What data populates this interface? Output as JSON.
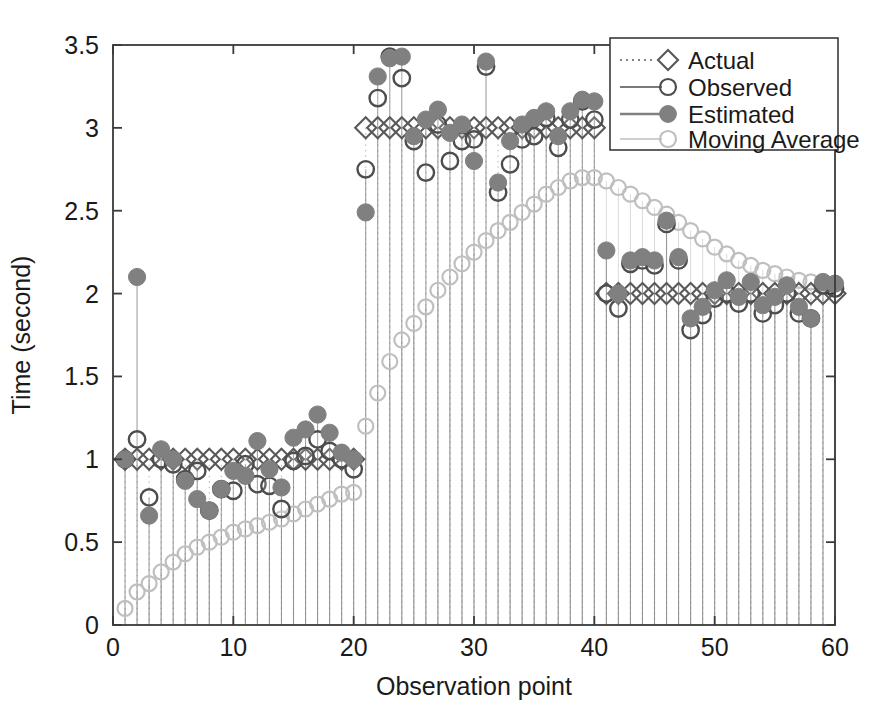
{
  "chart_data": {
    "type": "scatter",
    "title": "",
    "xlabel": "Observation point",
    "ylabel": "Time (second)",
    "xlim": [
      0,
      60
    ],
    "ylim": [
      0,
      3.5
    ],
    "xticks": [
      0,
      10,
      20,
      30,
      40,
      50,
      60
    ],
    "xtick_labels": [
      "0",
      "10",
      "20",
      "30",
      "40",
      "50",
      "60"
    ],
    "yticks": [
      0,
      0.5,
      1,
      1.5,
      2,
      2.5,
      3,
      3.5
    ],
    "ytick_labels": [
      "0",
      "0.5",
      "1",
      "1.5",
      "2",
      "2.5",
      "3",
      "3.5"
    ],
    "grid": false,
    "legend_position": "top-right",
    "x": [
      1,
      2,
      3,
      4,
      5,
      6,
      7,
      8,
      9,
      10,
      11,
      12,
      13,
      14,
      15,
      16,
      17,
      18,
      19,
      20,
      21,
      22,
      23,
      24,
      25,
      26,
      27,
      28,
      29,
      30,
      31,
      32,
      33,
      34,
      35,
      36,
      37,
      38,
      39,
      40,
      41,
      42,
      43,
      44,
      45,
      46,
      47,
      48,
      49,
      50,
      51,
      52,
      53,
      54,
      55,
      56,
      57,
      58,
      59,
      60
    ],
    "series": [
      {
        "name": "Actual",
        "marker": "diamond-open",
        "color": "#595959",
        "linestyle": "dotted",
        "values": [
          1,
          1,
          1,
          1,
          1,
          1,
          1,
          1,
          1,
          1,
          1,
          1,
          1,
          1,
          1,
          1,
          1,
          1,
          1,
          1,
          3,
          3,
          3,
          3,
          3,
          3,
          3,
          3,
          3,
          3,
          3,
          3,
          3,
          3,
          3,
          3,
          3,
          3,
          3,
          3,
          2,
          2,
          2,
          2,
          2,
          2,
          2,
          2,
          2,
          2,
          2,
          2,
          2,
          2,
          2,
          2,
          2,
          2,
          2,
          2
        ]
      },
      {
        "name": "Observed",
        "marker": "circle-open",
        "color": "#4d4d4d",
        "linestyle": "solid",
        "values": [
          1.0,
          1.12,
          0.77,
          1.0,
          0.97,
          0.88,
          0.93,
          0.69,
          0.82,
          0.81,
          0.97,
          0.85,
          0.84,
          0.7,
          0.99,
          1.02,
          1.12,
          1.05,
          1.0,
          0.94,
          2.75,
          3.18,
          3.43,
          3.3,
          2.92,
          2.73,
          3.02,
          2.8,
          2.92,
          2.93,
          3.37,
          2.61,
          2.78,
          2.93,
          2.95,
          3.06,
          2.88,
          3.05,
          3.16,
          3.05,
          2.0,
          1.91,
          2.18,
          2.2,
          2.17,
          2.42,
          2.2,
          1.78,
          1.87,
          1.97,
          2.0,
          1.94,
          2.0,
          1.88,
          1.93,
          2.0,
          1.88,
          1.85,
          2.05,
          2.03
        ]
      },
      {
        "name": "Estimated",
        "marker": "circle-filled",
        "color": "#808080",
        "linestyle": "solid",
        "values": [
          1.0,
          2.1,
          0.66,
          1.06,
          1.0,
          0.87,
          0.76,
          0.69,
          0.82,
          0.93,
          0.9,
          1.11,
          0.94,
          0.83,
          1.13,
          1.18,
          1.27,
          1.16,
          1.04,
          1.0,
          2.49,
          3.31,
          3.42,
          3.43,
          2.95,
          3.05,
          3.11,
          2.97,
          3.02,
          2.8,
          3.4,
          2.67,
          2.92,
          3.02,
          3.06,
          3.1,
          2.95,
          3.1,
          3.17,
          3.16,
          2.26,
          2.0,
          2.2,
          2.22,
          2.2,
          2.44,
          2.22,
          1.85,
          1.92,
          2.02,
          2.08,
          1.98,
          2.07,
          1.93,
          1.98,
          2.05,
          1.92,
          1.85,
          2.07,
          2.06
        ]
      },
      {
        "name": "Moving Average",
        "marker": "circle-open-light",
        "color": "#bfbfbf",
        "linestyle": "solid",
        "values": [
          0.1,
          0.2,
          0.25,
          0.32,
          0.38,
          0.43,
          0.47,
          0.5,
          0.53,
          0.56,
          0.58,
          0.6,
          0.62,
          0.64,
          0.67,
          0.7,
          0.73,
          0.76,
          0.79,
          0.8,
          1.2,
          1.4,
          1.59,
          1.72,
          1.82,
          1.92,
          2.02,
          2.1,
          2.18,
          2.25,
          2.32,
          2.38,
          2.43,
          2.49,
          2.54,
          2.6,
          2.64,
          2.68,
          2.7,
          2.7,
          2.68,
          2.64,
          2.6,
          2.56,
          2.52,
          2.48,
          2.43,
          2.38,
          2.33,
          2.28,
          2.24,
          2.2,
          2.17,
          2.14,
          2.12,
          2.1,
          2.08,
          2.07,
          2.06,
          2.06
        ]
      }
    ]
  },
  "legend": {
    "entries": [
      {
        "label": "Actual"
      },
      {
        "label": "Observed"
      },
      {
        "label": "Estimated"
      },
      {
        "label": "Moving Average"
      }
    ]
  },
  "colors": {
    "actual": "#595959",
    "observed": "#4d4d4d",
    "estimated": "#808080",
    "moving_average": "#bfbfbf",
    "axis": "#3a3a3a",
    "background": "#ffffff"
  }
}
